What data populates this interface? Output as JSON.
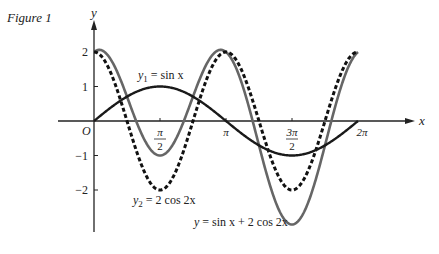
{
  "figure_title": "Figure 1",
  "chart_data": {
    "type": "line",
    "title": "Figure 1",
    "xlabel": "x",
    "ylabel": "y",
    "xlim": [
      0,
      6.2832
    ],
    "ylim": [
      -3,
      2.5
    ],
    "grid": false,
    "x_ticks": [
      {
        "value": 1.5708,
        "label_num": "π",
        "label_den": "2"
      },
      {
        "value": 3.1416,
        "label": "π"
      },
      {
        "value": 4.7124,
        "label_num": "3π",
        "label_den": "2"
      },
      {
        "value": 6.2832,
        "label": "2π"
      }
    ],
    "y_ticks": [
      {
        "value": 2,
        "label": "2"
      },
      {
        "value": 1,
        "label": "1"
      },
      {
        "value": -1,
        "label": "−1"
      },
      {
        "value": -2,
        "label": "−2"
      }
    ],
    "origin_label": "O",
    "series": [
      {
        "name": "y1 = sin x",
        "label_main": "y",
        "label_sub": "1",
        "label_rest": " = sin x",
        "expr": "sin",
        "style": "solid",
        "color": "#1a1a1a",
        "width": 2.4,
        "x": [
          0,
          0.785,
          1.571,
          2.356,
          3.142,
          3.927,
          4.712,
          5.498,
          6.283
        ],
        "values": [
          0,
          0.71,
          1,
          0.71,
          0,
          -0.71,
          -1,
          -0.71,
          0
        ]
      },
      {
        "name": "y2 = 2 cos 2x",
        "label_main": "y",
        "label_sub": "2",
        "label_rest": " = 2 cos 2x",
        "expr": "2cos2x",
        "style": "dashed",
        "color": "#111111",
        "width": 3,
        "x": [
          0,
          0.785,
          1.571,
          2.356,
          3.142,
          3.927,
          4.712,
          5.498,
          6.283
        ],
        "values": [
          2,
          0,
          -2,
          0,
          2,
          0,
          -2,
          0,
          2
        ]
      },
      {
        "name": "y = sin x + 2 cos 2x",
        "label_main": "y",
        "label_rest": " = sin x + 2 cos 2x",
        "expr": "sum",
        "style": "solid",
        "color": "#666666",
        "width": 2.6,
        "x": [
          0,
          0.785,
          1.571,
          2.356,
          3.142,
          3.927,
          4.712,
          5.498,
          6.283
        ],
        "values": [
          2,
          0.71,
          -1,
          0.71,
          2,
          -0.71,
          -3,
          -0.71,
          2
        ]
      }
    ]
  }
}
